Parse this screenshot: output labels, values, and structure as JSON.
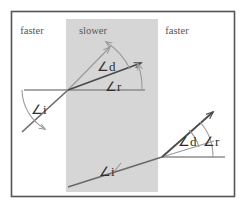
{
  "figure": {
    "frame": {
      "x": 11,
      "y": 11,
      "width": 224,
      "height": 186,
      "border_color": "#555555"
    },
    "background_color": "#ffffff",
    "medium_band": {
      "name": "slower-medium-band",
      "x": 66,
      "y": 19,
      "width": 92,
      "height": 173,
      "fill_color": "#d6d6d6"
    },
    "medium_labels": [
      {
        "text": "faster",
        "x": 32,
        "y": 34
      },
      {
        "text": "slower",
        "x": 93,
        "y": 34
      },
      {
        "text": "faster",
        "x": 177,
        "y": 34
      }
    ],
    "angle_labels": {
      "top_incidence": {
        "text": "∠i",
        "x": 31,
        "y": 114
      },
      "top_deviation": {
        "text": "∠d",
        "x": 97,
        "y": 71
      },
      "top_refraction": {
        "text": "∠r",
        "x": 105,
        "y": 91
      },
      "bottom_incidence": {
        "text": "∠i",
        "x": 99,
        "y": 176
      },
      "bottom_deviation": {
        "text": "∠d",
        "x": 178,
        "y": 146
      },
      "bottom_refraction": {
        "text": "∠r",
        "x": 203,
        "y": 146
      }
    },
    "colors": {
      "ray_dark": "#4a4a4a",
      "ray_light": "#9a9a9a",
      "normal_line": "#8d8d8d",
      "arc": "#9a9a9a"
    },
    "geometry": {
      "top_vertex": {
        "x": 68,
        "y": 90
      },
      "top_normal_line": {
        "x1": 24,
        "y1": 90,
        "x2": 145,
        "y2": 90
      },
      "top_incident_ray": {
        "x1": 22,
        "y1": 132,
        "x2": 68,
        "y2": 90
      },
      "top_undeviated_ray": {
        "x1": 68,
        "y1": 90,
        "x2": 111,
        "y2": 46
      },
      "top_refracted_ray": {
        "x1": 68,
        "y1": 90,
        "x2": 144,
        "y2": 62
      },
      "bottom_vertex": {
        "x": 162,
        "y": 157
      },
      "bottom_normal_line": {
        "x1": 162,
        "y1": 157,
        "x2": 225,
        "y2": 157
      },
      "bottom_incident_ray": {
        "x1": 68,
        "y1": 187,
        "x2": 162,
        "y2": 157
      },
      "bottom_undeviated_ray": {
        "x1": 162,
        "y1": 157,
        "x2": 213,
        "y2": 141
      },
      "bottom_refracted_ray": {
        "x1": 162,
        "y1": 157,
        "x2": 216,
        "y2": 110
      }
    }
  }
}
